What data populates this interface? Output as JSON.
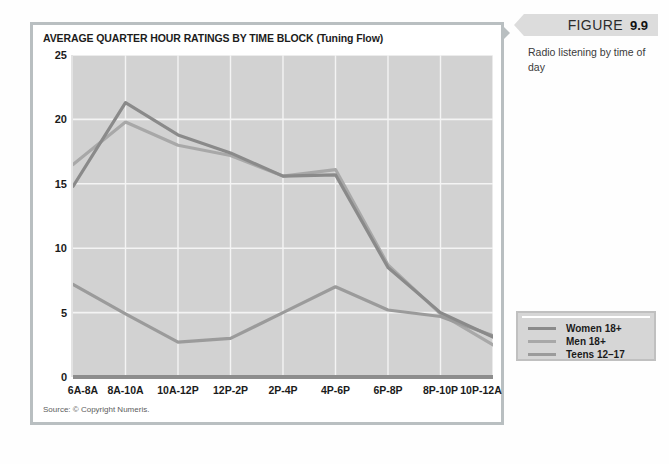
{
  "figure": {
    "tag_word": "FIGURE",
    "number": "9.9",
    "caption": "Radio listening by time of day"
  },
  "chart_title": "AVERAGE QUARTER HOUR RATINGS BY TIME BLOCK (Tuning Flow)",
  "source_note": "Source: © Copyright Numeris.",
  "colors": {
    "plot_background": "#d2d2d2",
    "gridline": "#f4f4f4",
    "axis_baseline": "#8d8d8d",
    "panel_border": "#b9bfc1",
    "women": "#8a8a8a",
    "men": "#a8a8a8",
    "teens": "#9b9b9b",
    "figure_tag_bg": "#dcdcdc",
    "legend_bg": "#d6d6d6"
  },
  "legend": {
    "position": "outside-right-bottom",
    "items": [
      {
        "label": "Women 18+",
        "color": "#8a8a8a"
      },
      {
        "label": "Men 18+",
        "color": "#a8a8a8"
      },
      {
        "label": "Teens 12–17",
        "color": "#9b9b9b"
      }
    ]
  },
  "chart_data": {
    "type": "line",
    "title": "AVERAGE QUARTER HOUR RATINGS BY TIME BLOCK (Tuning Flow)",
    "xlabel": "",
    "ylabel": "",
    "categories": [
      "6A-8A",
      "8A-10A",
      "10A-12P",
      "12P-2P",
      "2P-4P",
      "4P-6P",
      "6P-8P",
      "8P-10P",
      "10P-12A"
    ],
    "series": [
      {
        "name": "Women 18+",
        "color": "#8a8a8a",
        "values": [
          14.8,
          21.3,
          18.8,
          17.4,
          15.6,
          15.7,
          8.5,
          5.0,
          3.1
        ]
      },
      {
        "name": "Men 18+",
        "color": "#a8a8a8",
        "values": [
          16.5,
          19.8,
          18.0,
          17.2,
          15.6,
          16.1,
          8.7,
          4.9,
          2.5
        ]
      },
      {
        "name": "Teens 12–17",
        "color": "#9b9b9b",
        "values": [
          7.2,
          4.9,
          2.7,
          3.0,
          5.0,
          7.0,
          5.2,
          4.7,
          3.2
        ]
      }
    ],
    "ylim": [
      0,
      25
    ],
    "yticks": [
      0,
      5,
      10,
      15,
      20,
      25
    ],
    "ytick_labels": [
      "0",
      "5",
      "10",
      "15",
      "20",
      "25"
    ],
    "grid": true,
    "grid_axes": "both",
    "legend_position": "outside-right"
  }
}
